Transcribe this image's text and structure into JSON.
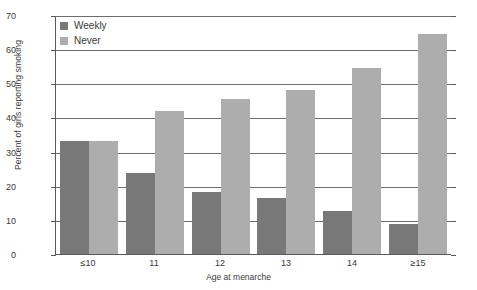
{
  "chart_data": {
    "type": "bar",
    "title": "",
    "xlabel": "Age at menarche",
    "ylabel": "Percent of girls reporting smoking",
    "categories": [
      "≤10",
      "11",
      "12",
      "13",
      "14",
      "≥15"
    ],
    "series": [
      {
        "name": "Weekly",
        "color": "#787878",
        "values": [
          33.2,
          23.8,
          18.2,
          16.5,
          12.5,
          8.8
        ]
      },
      {
        "name": "Never",
        "color": "#adadad",
        "values": [
          33.2,
          41.8,
          45.5,
          47.9,
          54.5,
          64.5
        ]
      }
    ],
    "ylim": [
      0,
      70
    ],
    "yticks": [
      0,
      10,
      20,
      30,
      40,
      50,
      60,
      70
    ],
    "grid": true,
    "legend_position": "top-left"
  },
  "legend": {
    "items": [
      {
        "label": "Weekly"
      },
      {
        "label": "Never"
      }
    ]
  }
}
